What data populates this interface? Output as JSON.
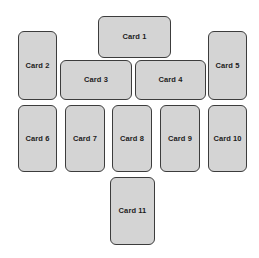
{
  "canvas": {
    "width": 259,
    "height": 258,
    "background_color": "#ffffff"
  },
  "style": {
    "card_fill_color": "#d4d4d4",
    "card_border_color": "#3c3c3c",
    "label_color": "#1c1c1c",
    "corner_radius": "6px"
  },
  "cards": [
    {
      "label": "Card 1",
      "x": 98,
      "y": 16,
      "w": 73,
      "h": 42,
      "orientation": "landscape"
    },
    {
      "label": "Card 2",
      "x": 18,
      "y": 31,
      "w": 39,
      "h": 69,
      "orientation": "portrait"
    },
    {
      "label": "Card 3",
      "x": 60,
      "y": 60,
      "w": 72,
      "h": 40,
      "orientation": "landscape"
    },
    {
      "label": "Card 4",
      "x": 135,
      "y": 60,
      "w": 71,
      "h": 40,
      "orientation": "landscape"
    },
    {
      "label": "Card 5",
      "x": 208,
      "y": 31,
      "w": 39,
      "h": 69,
      "orientation": "portrait"
    },
    {
      "label": "Card 6",
      "x": 18,
      "y": 105,
      "w": 39,
      "h": 67,
      "orientation": "portrait"
    },
    {
      "label": "Card 7",
      "x": 65,
      "y": 105,
      "w": 40,
      "h": 67,
      "orientation": "portrait"
    },
    {
      "label": "Card 8",
      "x": 112,
      "y": 105,
      "w": 40,
      "h": 67,
      "orientation": "portrait"
    },
    {
      "label": "Card 9",
      "x": 160,
      "y": 105,
      "w": 40,
      "h": 67,
      "orientation": "portrait"
    },
    {
      "label": "Card 10",
      "x": 208,
      "y": 105,
      "w": 39,
      "h": 67,
      "orientation": "portrait"
    },
    {
      "label": "Card 11",
      "x": 110,
      "y": 177,
      "w": 45,
      "h": 68,
      "orientation": "portrait"
    }
  ]
}
